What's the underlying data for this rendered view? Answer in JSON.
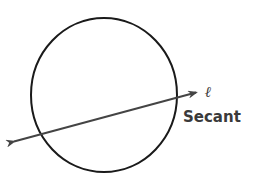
{
  "diagram": {
    "line_label": "ℓ",
    "line_name": "Secant",
    "colors": {
      "circle": "#1a1a1a",
      "line": "#444444",
      "text": "#3a3a3a",
      "background": "#ffffff"
    }
  }
}
